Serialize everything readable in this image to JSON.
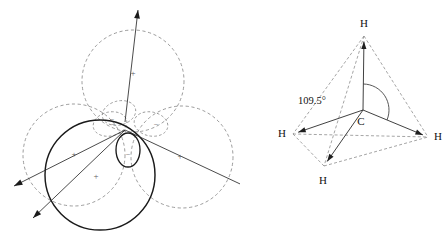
{
  "figure": {
    "background_color": "#ffffff",
    "width": 447,
    "height": 233
  },
  "orbital_diagram": {
    "name": "sp3-hybrid-orbitals",
    "center": {
      "x": 125,
      "y": 130
    },
    "dashed_color": "#8a8a8a",
    "solid_color": "#1a1a1a",
    "lobes": [
      {
        "id": "lobe-up",
        "style": "dashed",
        "sign": "+",
        "sign_x": 133,
        "sign_y": 74,
        "big_cx": 133,
        "big_cy": 81,
        "big_r": 51,
        "small_cx": 119,
        "small_cy": 113,
        "small_rx": 17,
        "small_ry": 12,
        "small_rot": -15,
        "small_sign": "−",
        "small_sign_x": 112,
        "small_sign_y": 120,
        "direction_deg": -90
      },
      {
        "id": "lobe-right",
        "style": "dashed",
        "sign": "+",
        "sign_x": 180,
        "sign_y": 157,
        "big_cx": 182,
        "big_cy": 157,
        "big_r": 51,
        "small_cx": 151,
        "small_cy": 124,
        "small_rx": 17,
        "small_ry": 12,
        "small_rot": 12,
        "small_sign": "−",
        "small_sign_x": 156,
        "small_sign_y": 125,
        "direction_deg": 30
      },
      {
        "id": "lobe-left",
        "style": "dashed",
        "sign": "+",
        "sign_x": 74,
        "sign_y": 155,
        "big_cx": 74,
        "big_cy": 155,
        "big_r": 51,
        "small_cx": 110,
        "small_cy": 124,
        "small_rx": 17,
        "small_ry": 12,
        "small_rot": -12,
        "small_sign": "−",
        "small_sign_x": 113,
        "small_sign_y": 125,
        "direction_deg": 150
      },
      {
        "id": "lobe-front",
        "style": "solid",
        "sign": "+",
        "sign_x": 96,
        "sign_y": 177,
        "big_cx": 100,
        "big_cy": 175,
        "big_r": 55,
        "small_cx": 128,
        "small_cy": 150,
        "small_rx": 12,
        "small_ry": 17,
        "small_rot": 0,
        "small_sign": "−",
        "small_sign_x": 128,
        "small_sign_y": 155,
        "direction_deg": 118
      }
    ],
    "axes": [
      {
        "id": "axis-up",
        "x1": 125,
        "y1": 122,
        "x2": 138,
        "y2": 10,
        "arrow": true
      },
      {
        "id": "axis-lower-left",
        "x1": 125,
        "y1": 130,
        "x2": 14,
        "y2": 186,
        "arrow": true
      },
      {
        "id": "axis-lower-left-2",
        "x1": 125,
        "y1": 130,
        "x2": 33,
        "y2": 218,
        "arrow": true
      },
      {
        "id": "axis-lower-right",
        "x1": 125,
        "y1": 130,
        "x2": 253,
        "y2": 190,
        "arrow": true
      }
    ]
  },
  "tetrahedron_diagram": {
    "name": "methane-tetrahedron",
    "angle_label": "109.5°",
    "angle_label_x": 58,
    "angle_label_y": 102,
    "dashed_color": "#8e8e8e",
    "solid_color": "#2b2b2b",
    "atoms": [
      {
        "id": "atom-c",
        "label": "C",
        "x": 123,
        "y": 110,
        "label_x": 121,
        "label_y": 122,
        "element": "carbon"
      },
      {
        "id": "atom-h-top",
        "label": "H",
        "x": 124,
        "y": 36,
        "label_x": 124,
        "label_y": 24,
        "element": "hydrogen"
      },
      {
        "id": "atom-h-left",
        "label": "H",
        "x": 53,
        "y": 134,
        "label_x": 42,
        "label_y": 134,
        "element": "hydrogen"
      },
      {
        "id": "atom-h-right",
        "label": "H",
        "x": 188,
        "y": 137,
        "label_x": 198,
        "label_y": 137,
        "element": "hydrogen"
      },
      {
        "id": "atom-h-bottom",
        "label": "H",
        "x": 84,
        "y": 166,
        "label_x": 83,
        "label_y": 181,
        "element": "hydrogen"
      }
    ],
    "bonds": [
      {
        "id": "bond-c-h-top",
        "from": "atom-c",
        "to": "atom-h-top",
        "style": "solid"
      },
      {
        "id": "bond-c-h-left",
        "from": "atom-c",
        "to": "atom-h-left",
        "style": "solid"
      },
      {
        "id": "bond-c-h-right",
        "from": "atom-c",
        "to": "atom-h-right",
        "style": "solid"
      },
      {
        "id": "bond-c-h-bottom",
        "from": "atom-c",
        "to": "atom-h-bottom",
        "style": "solid"
      }
    ],
    "edges": [
      {
        "id": "edge-top-left",
        "from": "atom-h-top",
        "to": "atom-h-left",
        "style": "dashed"
      },
      {
        "id": "edge-top-right",
        "from": "atom-h-top",
        "to": "atom-h-right",
        "style": "dashed"
      },
      {
        "id": "edge-top-bottom",
        "from": "atom-h-top",
        "to": "atom-h-bottom",
        "style": "dashed"
      },
      {
        "id": "edge-left-right",
        "from": "atom-h-left",
        "to": "atom-h-right",
        "style": "dashed"
      },
      {
        "id": "edge-left-bottom",
        "from": "atom-h-left",
        "to": "atom-h-bottom",
        "style": "dashed"
      },
      {
        "id": "edge-bottom-right",
        "from": "atom-h-bottom",
        "to": "atom-h-right",
        "style": "dashed"
      }
    ]
  }
}
